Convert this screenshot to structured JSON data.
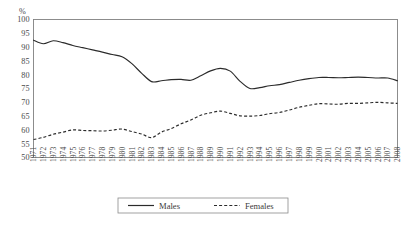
{
  "chart_data": {
    "type": "line",
    "title": "",
    "xlabel": "",
    "ylabel": "",
    "unit_label": "%",
    "ylim": [
      50,
      100
    ],
    "ytick_step": 5,
    "grid": true,
    "legend_position": "bottom-center",
    "yticks": [
      50,
      55,
      60,
      65,
      70,
      75,
      80,
      85,
      90,
      95,
      100
    ],
    "categories": [
      "1971",
      "1972",
      "1973",
      "1974",
      "1975",
      "1976",
      "1977",
      "1978",
      "1979",
      "1980",
      "1981",
      "1982",
      "1983",
      "1984",
      "1985",
      "1986",
      "1987",
      "1988",
      "1989",
      "1990",
      "1991",
      "1992",
      "1993",
      "1994",
      "1995",
      "1996",
      "1997",
      "1998",
      "1999",
      "2000",
      "2001",
      "2002",
      "2003",
      "2004",
      "2005",
      "2006",
      "2007",
      "2008"
    ],
    "series": [
      {
        "name": "Males",
        "style": "solid",
        "color": "#2b2b2b",
        "values": [
          92.5,
          91.2,
          92.3,
          91.6,
          90.6,
          89.8,
          89.0,
          88.2,
          87.3,
          86.5,
          84.0,
          80.5,
          77.5,
          77.8,
          78.2,
          78.3,
          78.0,
          79.6,
          81.4,
          82.3,
          81.3,
          77.6,
          75.0,
          75.3,
          76.0,
          76.4,
          77.2,
          78.0,
          78.6,
          79.0,
          79.0,
          78.9,
          79.0,
          79.1,
          79.0,
          78.8,
          78.8,
          77.8
        ]
      },
      {
        "name": "Females",
        "style": "dashed",
        "color": "#2b2b2b",
        "values": [
          56.5,
          57.3,
          58.4,
          59.2,
          60.0,
          59.8,
          59.7,
          59.6,
          59.9,
          60.3,
          59.4,
          58.5,
          57.2,
          59.2,
          60.5,
          62.2,
          63.6,
          65.3,
          66.2,
          66.8,
          66.0,
          65.1,
          65.0,
          65.2,
          65.9,
          66.3,
          67.2,
          68.2,
          68.9,
          69.5,
          69.4,
          69.3,
          69.6,
          69.6,
          69.8,
          70.0,
          69.8,
          69.6
        ]
      }
    ],
    "legend": [
      {
        "label": "Males",
        "style": "solid"
      },
      {
        "label": "Females",
        "style": "dashed"
      }
    ]
  }
}
